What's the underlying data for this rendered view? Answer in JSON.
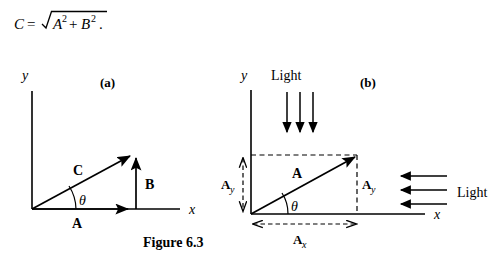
{
  "figure": {
    "caption": "Figure 6.3",
    "equation": {
      "lhs": "C",
      "equals": "=",
      "radical": "√",
      "radicand_a": "A",
      "exp_a": "2",
      "plus": "+",
      "radicand_b": "B",
      "exp_b": "2",
      "period": "."
    },
    "colors": {
      "ink": "#000000",
      "background": "#ffffff"
    }
  },
  "panel_a": {
    "label": "(a)",
    "axis_x_label": "x",
    "axis_y_label": "y",
    "angle_label": "θ",
    "vectors": [
      {
        "name": "C",
        "label": "C",
        "role": "resultant-hypotenuse"
      },
      {
        "name": "A",
        "label": "A",
        "role": "horizontal-component"
      },
      {
        "name": "B",
        "label": "B",
        "role": "vertical-component"
      }
    ]
  },
  "panel_b": {
    "label": "(b)",
    "axis_x_label": "x",
    "axis_y_label": "y",
    "angle_label": "θ",
    "vector_label": "A",
    "component_y_left_base": "A",
    "component_y_left_sub": "y",
    "component_y_right_base": "A",
    "component_y_right_sub": "y",
    "component_x_base": "A",
    "component_x_sub": "x",
    "light_top_label": "Light",
    "light_right_label": "Light",
    "light_top_ray_count": 3,
    "light_right_ray_count": 3
  }
}
